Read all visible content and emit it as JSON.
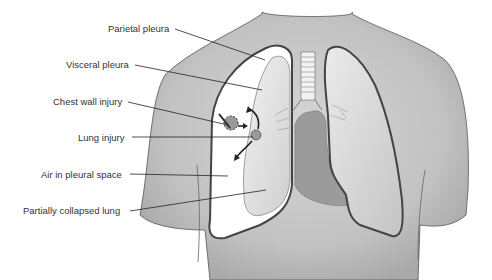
{
  "diagram": {
    "labels": [
      {
        "id": "parietal-pleura",
        "text": "Parietal pleura",
        "x": 108,
        "y": 23,
        "lx1": 175,
        "ly1": 29,
        "lx2": 265,
        "ly2": 60
      },
      {
        "id": "visceral-pleura",
        "text": "Visceral pleura",
        "x": 66,
        "y": 59,
        "lx1": 135,
        "ly1": 65,
        "lx2": 262,
        "ly2": 90
      },
      {
        "id": "chest-wall-injury",
        "text": "Chest wall injury",
        "x": 53,
        "y": 96,
        "lx1": 128,
        "ly1": 102,
        "lx2": 228,
        "ly2": 125
      },
      {
        "id": "lung-injury",
        "text": "Lung injury",
        "x": 78,
        "y": 132,
        "lx1": 132,
        "ly1": 137,
        "lx2": 253,
        "ly2": 137
      },
      {
        "id": "air-in-pleural-space",
        "text": "Air in pleural space",
        "x": 41,
        "y": 169,
        "lx1": 130,
        "ly1": 174,
        "lx2": 228,
        "ly2": 176
      },
      {
        "id": "partially-collapsed-lung",
        "text": "Partially collapsed lung",
        "x": 23,
        "y": 205,
        "lx1": 130,
        "ly1": 211,
        "lx2": 266,
        "ly2": 190
      }
    ],
    "colors": {
      "skin": "#c9c9c9",
      "skin_shadow": "#a8a8a8",
      "outline": "#444444",
      "lung_fill": "#dcdcdc",
      "pleural_space": "#ffffff",
      "heart": "#9a9a9a",
      "label_text": "#333333"
    }
  }
}
